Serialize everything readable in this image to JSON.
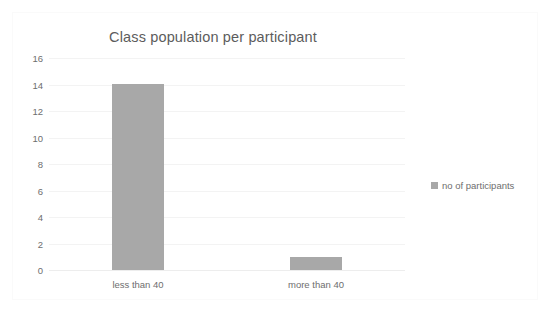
{
  "chart_data": {
    "type": "bar",
    "title": "Class population per participant",
    "xlabel": "",
    "ylabel": "",
    "categories": [
      "less than 40",
      "more than 40"
    ],
    "values": [
      14,
      1
    ],
    "series": [
      {
        "name": "no of participants",
        "values": [
          14,
          1
        ]
      }
    ],
    "ylim": [
      0,
      16
    ],
    "ytick_step": 2,
    "yticks": [
      "16",
      "14",
      "12",
      "10",
      "8",
      "6",
      "4",
      "2",
      "0"
    ],
    "grid": "horizontal",
    "legend_position": "right",
    "colors": {
      "bar": "#a8a8a8",
      "title_text": "#5c5c5c",
      "tick_text": "#6e6e6e",
      "gridline": "#f3f3f3",
      "background": "#ffffff",
      "border": "#fafafa"
    }
  },
  "legend": {
    "entries": [
      {
        "label": "no of participants",
        "color": "#a8a8a8"
      }
    ]
  }
}
